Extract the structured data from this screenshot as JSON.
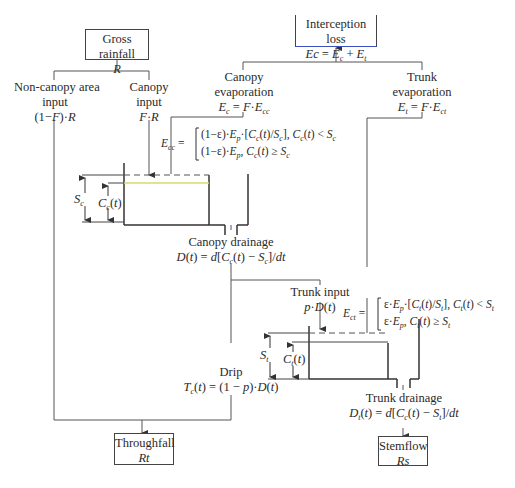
{
  "diagram": {
    "nodes": {
      "gross_rainfall": {
        "label": "Gross rainfall",
        "symbol": "R"
      },
      "interception_loss": {
        "label": "Interception loss",
        "formula": "Ec = E_c + E_t"
      },
      "non_canopy_input": {
        "label_line1": "Non-canopy area",
        "label_line2": "input",
        "formula": "(1−F)·R"
      },
      "canopy_input": {
        "label_line1": "Canopy",
        "label_line2": "input",
        "formula": "F·R"
      },
      "canopy_evaporation": {
        "label_line1": "Canopy",
        "label_line2": "evaporation",
        "formula": "E_c = F·E_cc"
      },
      "trunk_evaporation": {
        "label_line1": "Trunk",
        "label_line2": "evaporation",
        "formula": "E_t = F·E_ct"
      },
      "canopy_drainage": {
        "label": "Canopy drainage",
        "formula": "D(t) = d[C_c(t) − S_c]/dt"
      },
      "trunk_input": {
        "label": "Trunk input",
        "formula": "p·D(t)"
      },
      "drip": {
        "label": "Drip",
        "formula": "T_c(t) = (1 − p)·D(t)"
      },
      "trunk_drainage": {
        "label": "Trunk drainage",
        "formula": "D_t(t) = d[C_c(t) − S_t]/dt"
      },
      "throughfall": {
        "label": "Throughfall",
        "symbol": "Rt"
      },
      "stemflow": {
        "label": "Stemflow",
        "symbol": "Rs"
      }
    },
    "equations": {
      "E_cc": {
        "lhs": "E_cc =",
        "case1": "(1−ε)·E_p·[C_c(t)/S_c], C_c(t) < S_c",
        "case2": "(1−ε)·E_p, C_c(t) ≥ S_c"
      },
      "E_ct": {
        "lhs": "E_ct =",
        "case1": "ε·E_p·[C_t(t)/S_t], C_t(t) < S_t",
        "case2": "ε·E_p, C_t(t) ≥ S_t"
      }
    },
    "storages": {
      "canopy": {
        "capacity_label": "S_c",
        "content_label": "C_c(t)"
      },
      "trunk": {
        "capacity_label": "S_t",
        "content_label": "C_t(t)"
      }
    },
    "colors": {
      "line": "#444444",
      "accent_blue": "#3b4fc0",
      "water_level": "#d8d870"
    }
  }
}
